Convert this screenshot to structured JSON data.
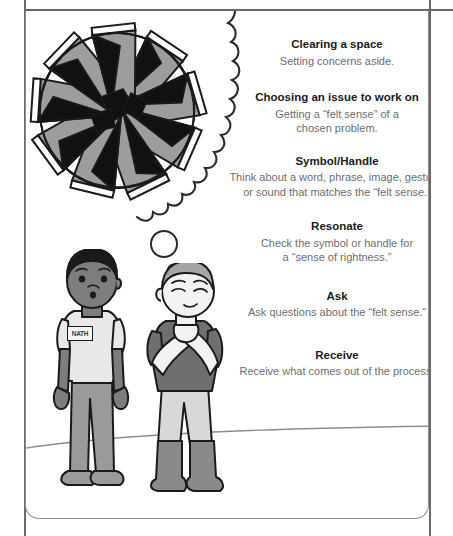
{
  "panel": {
    "ghost_header_text": "",
    "illustration": {
      "mandala": {
        "name": "geometric-star-mandala",
        "petals": 9,
        "colors": {
          "fill_light": "#9d9d9d",
          "fill_dark": "#111111",
          "stroke": "#1a1a1a",
          "highlight": "#ffffff"
        }
      },
      "thought_cloud": {
        "name": "thought-cloud",
        "bubbles": 2
      },
      "figure_left": {
        "name": "standing-person",
        "badge_text": "NATH",
        "colors": {
          "hair": "#1a1a1a",
          "skin": "#7d7d7d",
          "shirt": "#e8e8e8",
          "pants": "#9a9a9a",
          "shoes": "#9a9a9a"
        }
      },
      "figure_right": {
        "name": "thinking-person",
        "colors": {
          "hair": "#a5a5a5",
          "skin": "#f2f2f2",
          "shirt": "#6f6f6f",
          "pants": "#d8d8d8",
          "boots": "#8a8a8a"
        }
      },
      "ground": {
        "name": "horizon-line",
        "color": "#8d8d8d"
      }
    },
    "steps": [
      {
        "title": "Clearing a space",
        "body": "Setting concerns aside."
      },
      {
        "title": "Choosing an issue to work on",
        "body": "Getting a “felt sense” of a\nchosen problem."
      },
      {
        "title": "Symbol/Handle",
        "body": "Think about a word, phrase, image, gesture,\nor sound that matches the “felt sense.”"
      },
      {
        "title": "Resonate",
        "body": "Check the symbol or handle for\na “sense of rightness.”"
      },
      {
        "title": "Ask",
        "body": "Ask questions about the “felt sense.”"
      },
      {
        "title": "Receive",
        "body": "Receive what comes out of the process."
      }
    ]
  },
  "colors": {
    "title_text": "#1b1b1b",
    "body_text": "#6e6e6e",
    "panel_border": "#8d8d8d",
    "frame_line": "#6a6a6a"
  }
}
